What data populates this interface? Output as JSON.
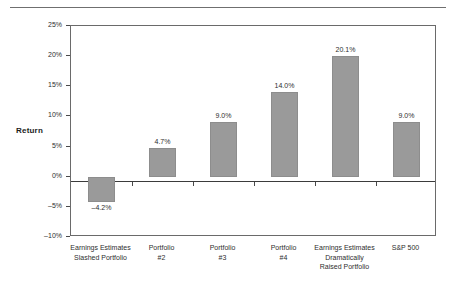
{
  "chart_data": {
    "type": "bar",
    "title": "",
    "subtitle": "",
    "xlabel": "",
    "ylabel": "Return",
    "ylim": [
      -10,
      25
    ],
    "ytick_values": [
      25,
      20,
      15,
      10,
      5,
      0,
      -5,
      -10
    ],
    "ytick_labels": [
      "25%",
      "20%",
      "15%",
      "10%",
      "5%",
      "0%",
      "–5%",
      "–10%"
    ],
    "grid": false,
    "legend": null,
    "categories": [
      "Earnings Estimates Slashed Portfolio",
      "Portfolio #2",
      "Portfolio #3",
      "Portfolio #4",
      "Earnings Estimates Dramatically Raised Portfolio",
      "S&P 500"
    ],
    "category_label_lines": [
      [
        "Earnings Estimates",
        "Slashed Portfolio"
      ],
      [
        "Portfolio",
        "#2"
      ],
      [
        "Portfolio",
        "#3"
      ],
      [
        "Portfolio",
        "#4"
      ],
      [
        "Earnings Estimates",
        "Dramatically",
        "Raised Portfolio"
      ],
      [
        "S&P 500"
      ]
    ],
    "values": [
      -4.2,
      4.7,
      9.0,
      14.0,
      20.1,
      9.0
    ],
    "value_labels": [
      "–4.2%",
      "4.7%",
      "9.0%",
      "14.0%",
      "20.1%",
      "9.0%"
    ],
    "bar_color": "#9a9a9a",
    "axis_color": "#6a6a6a",
    "zero_line_color": "#3b3b3b"
  }
}
